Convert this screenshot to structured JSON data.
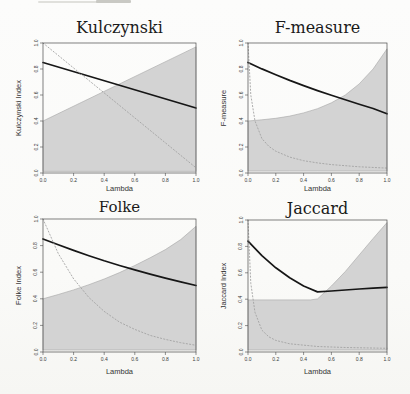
{
  "page": {
    "background": "#fbfbfa"
  },
  "chart_data": [
    {
      "type": "line",
      "title": "Kulczynski",
      "xlabel": "Lambda",
      "ylabel": "Kulczynski Index",
      "xlim": [
        0,
        1
      ],
      "ylim": [
        0,
        1
      ],
      "grid": false,
      "xtick_labels": [
        "0.0",
        "0.2",
        "0.4",
        "0.6",
        "0.8",
        "1.0"
      ],
      "ytick_labels": [
        "0.0",
        "0.2",
        "0.4",
        "0.6",
        "0.8",
        "1.0"
      ],
      "band": {
        "label": "shaded-region",
        "fill": "#d3d3d3",
        "edge": "#a5a5a5",
        "x": [
          0,
          1
        ],
        "upper": [
          0.4,
          0.97
        ],
        "lower": [
          0.012,
          0.012
        ]
      },
      "series": [
        {
          "name": "index-curve",
          "style": "solid",
          "color": "#161616",
          "width": 1.7,
          "x": [
            0,
            1
          ],
          "y": [
            0.85,
            0.5
          ]
        },
        {
          "name": "reference-curve",
          "style": "dotted",
          "color": "#a3a3a3",
          "width": 0.9,
          "x": [
            0,
            0.5,
            1
          ],
          "y": [
            1.0,
            0.52,
            0.04
          ]
        }
      ]
    },
    {
      "type": "line",
      "title": "F-measure",
      "xlabel": "Lambda",
      "ylabel": "F-measure",
      "xlim": [
        0,
        1
      ],
      "ylim": [
        0,
        1
      ],
      "grid": false,
      "xtick_labels": [
        "0.0",
        "0.2",
        "0.4",
        "0.6",
        "0.8",
        "1.0"
      ],
      "ytick_labels": [
        "0.0",
        "0.2",
        "0.4",
        "0.6",
        "0.8",
        "1.0"
      ],
      "band": {
        "label": "shaded-region",
        "fill": "#d3d3d3",
        "edge": "#a5a5a5",
        "x": [
          0,
          0.1,
          0.2,
          0.3,
          0.4,
          0.5,
          0.6,
          0.7,
          0.8,
          0.9,
          1.0
        ],
        "upper": [
          0.4,
          0.409,
          0.421,
          0.438,
          0.462,
          0.495,
          0.54,
          0.6,
          0.685,
          0.8,
          0.955
        ],
        "lower": [
          0.015,
          0.015,
          0.015,
          0.015,
          0.015,
          0.015,
          0.015,
          0.015,
          0.015,
          0.015,
          0.015
        ]
      },
      "series": [
        {
          "name": "index-curve",
          "style": "solid",
          "color": "#161616",
          "width": 1.7,
          "x": [
            0,
            0.1,
            0.2,
            0.3,
            0.4,
            0.5,
            0.6,
            0.7,
            0.8,
            0.9,
            1.0
          ],
          "y": [
            0.85,
            0.801,
            0.755,
            0.712,
            0.672,
            0.634,
            0.598,
            0.563,
            0.529,
            0.496,
            0.455
          ]
        },
        {
          "name": "reference-curve",
          "style": "dotted",
          "color": "#a3a3a3",
          "width": 0.9,
          "x": [
            0,
            0.02,
            0.05,
            0.1,
            0.15,
            0.2,
            0.3,
            0.4,
            0.5,
            0.6,
            0.8,
            1.0
          ],
          "y": [
            1.0,
            0.6,
            0.4,
            0.265,
            0.205,
            0.168,
            0.122,
            0.095,
            0.078,
            0.065,
            0.048,
            0.038
          ]
        }
      ]
    },
    {
      "type": "line",
      "title": "Folke",
      "xlabel": "Lambda",
      "ylabel": "Folke Index",
      "xlim": [
        0,
        1
      ],
      "ylim": [
        0,
        1
      ],
      "grid": false,
      "xtick_labels": [
        "0.0",
        "0.2",
        "0.4",
        "0.6",
        "0.8",
        "1.0"
      ],
      "ytick_labels": [
        "0.0",
        "0.2",
        "0.4",
        "0.6",
        "0.8",
        "1.0"
      ],
      "band": {
        "label": "shaded-region",
        "fill": "#d3d3d3",
        "edge": "#a5a5a5",
        "x": [
          0,
          0.1,
          0.2,
          0.3,
          0.4,
          0.5,
          0.6,
          0.7,
          0.8,
          0.9,
          1.0
        ],
        "upper": [
          0.4,
          0.432,
          0.467,
          0.506,
          0.549,
          0.597,
          0.65,
          0.708,
          0.77,
          0.845,
          0.945
        ],
        "lower": [
          0.015,
          0.015,
          0.015,
          0.015,
          0.015,
          0.015,
          0.015,
          0.015,
          0.015,
          0.015,
          0.015
        ]
      },
      "series": [
        {
          "name": "index-curve",
          "style": "solid",
          "color": "#161616",
          "width": 1.7,
          "x": [
            0,
            0.1,
            0.2,
            0.3,
            0.4,
            0.5,
            0.6,
            0.7,
            0.8,
            0.9,
            1.0
          ],
          "y": [
            0.85,
            0.806,
            0.764,
            0.724,
            0.686,
            0.65,
            0.617,
            0.586,
            0.556,
            0.528,
            0.5
          ]
        },
        {
          "name": "reference-curve",
          "style": "dotted",
          "color": "#a3a3a3",
          "width": 0.9,
          "x": [
            0,
            0.1,
            0.2,
            0.3,
            0.4,
            0.5,
            0.6,
            0.7,
            0.8,
            0.9,
            1.0
          ],
          "y": [
            1.0,
            0.74,
            0.55,
            0.41,
            0.305,
            0.225,
            0.17,
            0.125,
            0.095,
            0.07,
            0.05
          ]
        }
      ]
    },
    {
      "type": "line",
      "title": "Jaccard",
      "xlabel": "Lambda",
      "ylabel": "Jaccard Index",
      "xlim": [
        0,
        1
      ],
      "ylim": [
        0,
        1
      ],
      "grid": false,
      "xtick_labels": [
        "0.0",
        "0.2",
        "0.4",
        "0.6",
        "0.8",
        "1.0"
      ],
      "ytick_labels": [
        "0.0",
        "0.2",
        "0.4",
        "0.6",
        "0.8",
        "1.0"
      ],
      "band": {
        "label": "shaded-region",
        "fill": "#d3d3d3",
        "edge": "#a5a5a5",
        "x": [
          0,
          0.45,
          0.5,
          0.6,
          0.7,
          0.8,
          0.9,
          1.0
        ],
        "upper": [
          0.395,
          0.395,
          0.402,
          0.5,
          0.61,
          0.735,
          0.86,
          0.98
        ],
        "lower": [
          0.015,
          0.015,
          0.015,
          0.015,
          0.015,
          0.015,
          0.015,
          0.015
        ]
      },
      "series": [
        {
          "name": "index-curve",
          "style": "solid",
          "color": "#161616",
          "width": 1.7,
          "x": [
            0,
            0.1,
            0.2,
            0.3,
            0.4,
            0.5,
            0.6,
            0.7,
            0.8,
            0.9,
            1.0
          ],
          "y": [
            0.84,
            0.73,
            0.638,
            0.562,
            0.5,
            0.455,
            0.462,
            0.47,
            0.477,
            0.484,
            0.49
          ]
        },
        {
          "name": "reference-curve",
          "style": "dotted",
          "color": "#a3a3a3",
          "width": 0.9,
          "x": [
            0,
            0.02,
            0.05,
            0.1,
            0.15,
            0.2,
            0.3,
            0.5,
            0.7,
            1.0
          ],
          "y": [
            1.0,
            0.52,
            0.3,
            0.165,
            0.115,
            0.088,
            0.062,
            0.042,
            0.034,
            0.028
          ]
        }
      ]
    }
  ]
}
